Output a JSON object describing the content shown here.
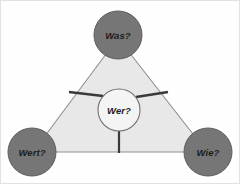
{
  "canvas": {
    "width": 240,
    "height": 184,
    "background": "#fefefe",
    "border_color": "#e2e2e2"
  },
  "colors": {
    "triangle_fill": "#e8e8e8",
    "triangle_stroke": "#8f8f8f",
    "corner_node_fill": "#767676",
    "corner_node_stroke": "#5e5e5e",
    "center_node_fill": "#f4f4f4",
    "center_node_stroke": "#6f6f6f",
    "spoke_color": "#3a3a3a",
    "label_color": "#1c1c1c"
  },
  "diagram": {
    "type": "triangle-hub-and-spoke",
    "triangle": {
      "name": "value-triangle",
      "vertices": [
        {
          "x": 118,
          "y": 38
        },
        {
          "x": 33,
          "y": 152
        },
        {
          "x": 207,
          "y": 152
        }
      ]
    },
    "center_node": {
      "id": "wer",
      "label": "Wer?",
      "cx": 119,
      "cy": 110,
      "r": 21,
      "icon": "circle-node-icon"
    },
    "corner_nodes": [
      {
        "id": "was",
        "label": "Was?",
        "cx": 118,
        "cy": 35,
        "r": 24,
        "position": "top",
        "icon": "circle-node-icon"
      },
      {
        "id": "wert",
        "label": "Wert?",
        "cx": 32,
        "cy": 152,
        "r": 24,
        "position": "bottom-left",
        "icon": "circle-node-icon"
      },
      {
        "id": "wie",
        "label": "Wie?",
        "cx": 208,
        "cy": 152,
        "r": 24,
        "position": "bottom-right",
        "icon": "circle-node-icon"
      }
    ],
    "spokes": [
      {
        "id": "spoke-upper-left",
        "from": {
          "x": 103,
          "y": 96
        },
        "to": {
          "x": 70,
          "y": 92
        },
        "width": 2.6
      },
      {
        "id": "spoke-upper-right",
        "from": {
          "x": 136,
          "y": 97
        },
        "to": {
          "x": 167,
          "y": 92
        },
        "width": 2.6
      },
      {
        "id": "spoke-down",
        "from": {
          "x": 119,
          "y": 131
        },
        "to": {
          "x": 119,
          "y": 152
        },
        "width": 2.2
      }
    ]
  }
}
